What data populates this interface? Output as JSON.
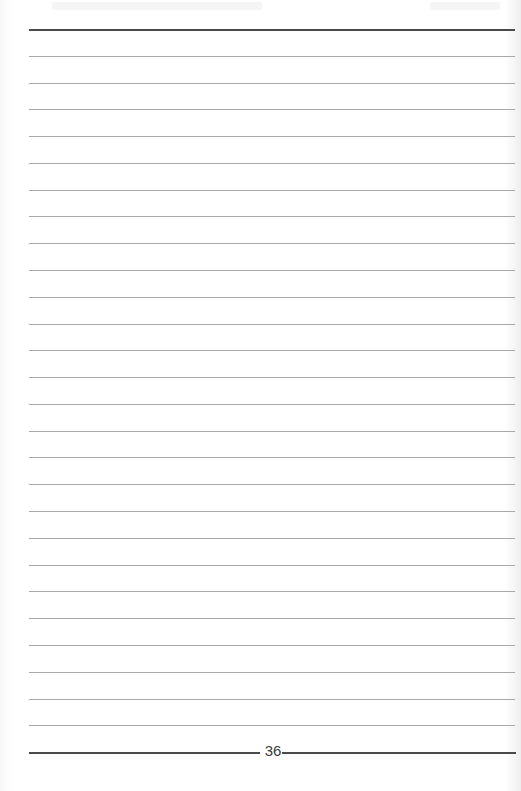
{
  "document": {
    "type": "lined notebook page",
    "page_number": "36",
    "ruled_lines": {
      "top_thick_y": 29,
      "bottom_thick_y": 752,
      "thin_line_count": 26,
      "spacing_px": 26.78
    },
    "colors": {
      "paper": "#ffffff",
      "thin_line": "#a9a9a9",
      "thick_line": "#4a4a4a",
      "page_number": "#3a3a3a"
    }
  }
}
